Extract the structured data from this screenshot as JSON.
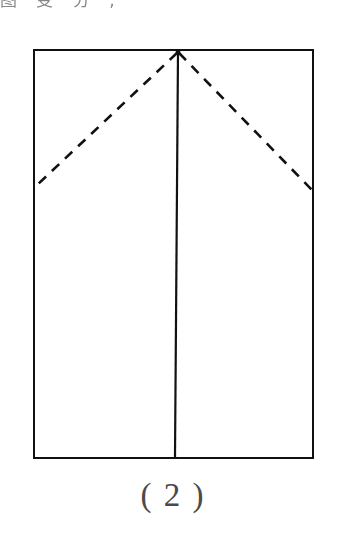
{
  "figure": {
    "caption": "( 2 )",
    "header_fragment": "图 变 分 ,",
    "ink_color": "#111111",
    "caption_color": "#4a4a4a",
    "background_color": "#ffffff",
    "elements": [
      {
        "name": "rectangle-outline",
        "kind": "solid",
        "label": "paper outline"
      },
      {
        "name": "vertical-crease",
        "kind": "solid",
        "label": "vertical fold line"
      },
      {
        "name": "left-diagonal-crease",
        "kind": "dashed",
        "label": "left diagonal fold line"
      },
      {
        "name": "right-diagonal-crease",
        "kind": "dashed",
        "label": "right diagonal fold line"
      }
    ]
  },
  "geometry": {
    "rect": {
      "x1": 34,
      "y1": 50,
      "x2": 313,
      "y2": 458
    },
    "apex": {
      "x": 178,
      "y": 52
    },
    "vertical_bottom": {
      "x": 175,
      "y": 457
    },
    "left_end": {
      "x": 36,
      "y": 186
    },
    "right_end": {
      "x": 312,
      "y": 190
    },
    "stroke_width": 2.3,
    "dash_pattern": "10 8"
  }
}
